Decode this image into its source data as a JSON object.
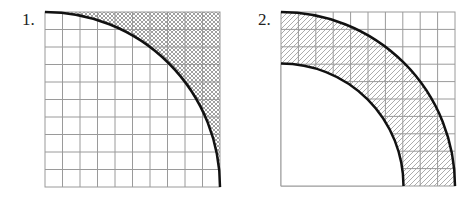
{
  "figures": [
    {
      "label": "1.",
      "grid_cells": 10,
      "shading": "crosshatch",
      "description": "Quarter circle of radius 10 in a 10x10 grid; region outside arc shaded"
    },
    {
      "label": "2.",
      "grid_cells": 10,
      "shading": "diagonal-hatch",
      "description": "Quarter annulus with outer radius 10 and inner radius 7 in a 10x10 grid; annulus shaded"
    }
  ],
  "colors": {
    "grid": "#9a9a9a",
    "arc": "#111111",
    "hatch": "#777777"
  }
}
